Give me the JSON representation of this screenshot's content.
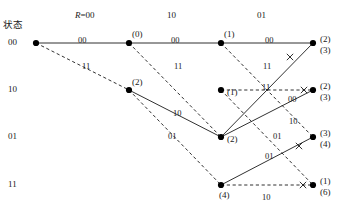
{
  "diagram": {
    "type": "trellis",
    "title_label": "状态",
    "width": 345,
    "height": 207,
    "colors": {
      "line": "#1a1a1a",
      "node": "#000000",
      "text": "#1a1a1a"
    },
    "columns": [
      {
        "label": "R=00",
        "italic_prefix": "R",
        "x": 85
      },
      {
        "label": "10",
        "x": 177
      },
      {
        "label": "01",
        "x": 267
      }
    ],
    "row_states": [
      {
        "label": "00",
        "y": 43
      },
      {
        "label": "10",
        "y": 90
      },
      {
        "label": "01",
        "y": 137
      },
      {
        "label": "11",
        "y": 185
      }
    ],
    "column_x": [
      36,
      129,
      221,
      313
    ],
    "nodes": [
      {
        "id": "n0",
        "x": 36,
        "y": 43,
        "metric": ""
      },
      {
        "id": "n1a",
        "x": 129,
        "y": 43,
        "metric": "(0)"
      },
      {
        "id": "n1b",
        "x": 129,
        "y": 90,
        "metric": "(2)"
      },
      {
        "id": "n2a",
        "x": 221,
        "y": 43,
        "metric": "(1)"
      },
      {
        "id": "n2b",
        "x": 221,
        "y": 90,
        "metric": "(1)"
      },
      {
        "id": "n2c",
        "x": 221,
        "y": 137,
        "metric": "(2)"
      },
      {
        "id": "n2d",
        "x": 221,
        "y": 185,
        "metric": "(4)"
      },
      {
        "id": "n3a",
        "x": 313,
        "y": 43,
        "metric": "(2)",
        "metric2": "(3)"
      },
      {
        "id": "n3b",
        "x": 313,
        "y": 90,
        "metric": "(2)",
        "metric2": "(3)"
      },
      {
        "id": "n3c",
        "x": 313,
        "y": 137,
        "metric": "(3)",
        "metric2": "(4)"
      },
      {
        "id": "n3d",
        "x": 313,
        "y": 185,
        "metric": "(1)",
        "metric2": "(6)"
      }
    ],
    "edges": [
      {
        "from": "n0",
        "to": "n1a",
        "style": "solid",
        "label": "00",
        "lx": 78,
        "ly": 36
      },
      {
        "from": "n0",
        "to": "n1b",
        "style": "dashed",
        "label": "11",
        "lx": 82,
        "ly": 62
      },
      {
        "from": "n1a",
        "to": "n2a",
        "style": "solid",
        "label": "00",
        "lx": 171,
        "ly": 36
      },
      {
        "from": "n1a",
        "to": "n2c",
        "style": "dashed",
        "label": "11",
        "lx": 174,
        "ly": 62
      },
      {
        "from": "n1b",
        "to": "n2c",
        "style": "solid",
        "label": "10",
        "lx": 173,
        "ly": 109
      },
      {
        "from": "n1b",
        "to": "n2d",
        "style": "dashed",
        "label": "01",
        "lx": 168,
        "ly": 132
      },
      {
        "from": "n2a",
        "to": "n3a",
        "style": "solid",
        "label": "00",
        "lx": 265,
        "ly": 36
      },
      {
        "from": "n2a",
        "to": "n3c",
        "style": "dashed",
        "label": "11",
        "lx": 263,
        "ly": 62
      },
      {
        "from": "n2b",
        "to": "n3b",
        "style": "dashed",
        "label": "00",
        "lx": 288,
        "ly": 95
      },
      {
        "from": "n2b",
        "to": "n3d",
        "style": "dashed",
        "label": "01",
        "lx": 273,
        "ly": 132
      },
      {
        "from": "n2c",
        "to": "n3a",
        "style": "solid",
        "label": "11",
        "lx": 262,
        "ly": 83
      },
      {
        "from": "n2c",
        "to": "n3b",
        "style": "solid",
        "label": "10",
        "lx": 289,
        "ly": 117
      },
      {
        "from": "n2d",
        "to": "n3c",
        "style": "solid",
        "label": "01",
        "lx": 265,
        "ly": 152
      },
      {
        "from": "n2d",
        "to": "n3d",
        "style": "dashed",
        "label": "10",
        "lx": 262,
        "ly": 193
      }
    ],
    "pruned_marks": [
      {
        "x": 304,
        "y": 90
      },
      {
        "x": 299,
        "y": 146
      },
      {
        "x": 303,
        "y": 185
      },
      {
        "x": 290,
        "y": 57
      }
    ]
  }
}
